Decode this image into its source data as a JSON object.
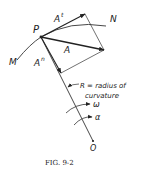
{
  "figure": {
    "caption": "FIG. 9-2",
    "labels": {
      "point_p": "P",
      "curve_start": "M",
      "curve_end": "N",
      "tangential": "A",
      "tangential_sup": "t",
      "total": "A",
      "normal": "A",
      "normal_sup": "n",
      "radius_line1": "R = radius of",
      "radius_line2": "curvature",
      "angular_velocity": "ω",
      "angular_acceleration": "α",
      "center": "O"
    }
  }
}
